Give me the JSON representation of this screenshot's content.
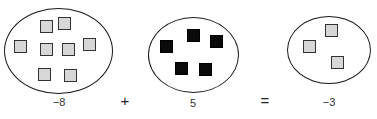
{
  "diagram": {
    "type": "integer-tile-addition",
    "equation": {
      "left_value": "−8",
      "operator_plus": "+",
      "right_value": "5",
      "operator_equals": "=",
      "result_value": "−3"
    },
    "sets": [
      {
        "name": "negative-eight-set",
        "tile_kind": "negative",
        "tile_count": 8,
        "tiles": [
          {
            "x": 40,
            "y": 20
          },
          {
            "x": 58,
            "y": 17
          },
          {
            "x": 14,
            "y": 40
          },
          {
            "x": 40,
            "y": 43
          },
          {
            "x": 62,
            "y": 43
          },
          {
            "x": 83,
            "y": 38
          },
          {
            "x": 38,
            "y": 68
          },
          {
            "x": 64,
            "y": 69
          }
        ]
      },
      {
        "name": "positive-five-set",
        "tile_kind": "positive",
        "tile_count": 5,
        "tiles": [
          {
            "x": 187,
            "y": 29
          },
          {
            "x": 210,
            "y": 35
          },
          {
            "x": 160,
            "y": 40
          },
          {
            "x": 175,
            "y": 62
          },
          {
            "x": 199,
            "y": 63
          }
        ]
      },
      {
        "name": "negative-three-set",
        "tile_kind": "negative",
        "tile_count": 3,
        "tiles": [
          {
            "x": 325,
            "y": 24
          },
          {
            "x": 303,
            "y": 40
          },
          {
            "x": 331,
            "y": 56
          }
        ]
      }
    ],
    "colors": {
      "negative_tile_fill": "#d7d7d7",
      "negative_tile_border": "#333333",
      "positive_tile_fill": "#0a0a0a",
      "ellipse_stroke": "#1a1a1a",
      "background": "#ffffff"
    }
  }
}
